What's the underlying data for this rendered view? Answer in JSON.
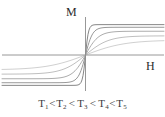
{
  "figure": {
    "axis_labels": {
      "y": "M",
      "x": "H"
    },
    "caption_terms": [
      {
        "symbol": "T",
        "subscript": "1"
      },
      {
        "symbol": "T",
        "subscript": "2"
      },
      {
        "symbol": "T",
        "subscript": "3"
      },
      {
        "symbol": "T",
        "subscript": "4"
      },
      {
        "symbol": "T",
        "subscript": "5"
      }
    ],
    "caption_relation": "<",
    "caption_text": "T1<T2< T3< T4<T5"
  },
  "colors": {
    "axis": "#8c8c8c",
    "curve_darkest": "#707070",
    "curve_lightest": "#c8c8c8",
    "text": "#2b2b2b",
    "caption_text": "#3a3a3a",
    "background": "#ffffff"
  },
  "chart_data": {
    "type": "line",
    "title": "",
    "xlabel": "H",
    "ylabel": "M",
    "xlim": [
      -1,
      1
    ],
    "ylim": [
      -1,
      1
    ],
    "grid": false,
    "legend": "none",
    "axis_style": "centered-cross",
    "annotations": [
      "T1<T2< T3< T4<T5"
    ],
    "series": [
      {
        "name": "T1",
        "saturation": 0.92,
        "steepness": 26,
        "color": "#707070",
        "x": [
          -1,
          -0.8,
          -0.6,
          -0.4,
          -0.25,
          -0.15,
          -0.08,
          -0.04,
          0,
          0.04,
          0.08,
          0.15,
          0.25,
          0.4,
          0.6,
          0.8,
          1
        ],
        "y": [
          -0.92,
          -0.92,
          -0.92,
          -0.92,
          -0.91,
          -0.9,
          -0.85,
          -0.7,
          0,
          0.7,
          0.85,
          0.9,
          0.91,
          0.92,
          0.92,
          0.92,
          0.92
        ]
      },
      {
        "name": "T2",
        "saturation": 0.84,
        "steepness": 11,
        "color": "#878787",
        "x": [
          -1,
          -0.8,
          -0.6,
          -0.4,
          -0.25,
          -0.15,
          -0.08,
          -0.04,
          0,
          0.04,
          0.08,
          0.15,
          0.25,
          0.4,
          0.6,
          0.8,
          1
        ],
        "y": [
          -0.84,
          -0.84,
          -0.83,
          -0.82,
          -0.79,
          -0.72,
          -0.55,
          -0.33,
          0,
          0.33,
          0.55,
          0.72,
          0.79,
          0.82,
          0.83,
          0.84,
          0.84
        ]
      },
      {
        "name": "T3",
        "saturation": 0.72,
        "steepness": 6,
        "color": "#9d9d9d",
        "x": [
          -1,
          -0.8,
          -0.6,
          -0.4,
          -0.25,
          -0.15,
          -0.08,
          -0.04,
          0,
          0.04,
          0.08,
          0.15,
          0.25,
          0.4,
          0.6,
          0.8,
          1
        ],
        "y": [
          -0.72,
          -0.71,
          -0.7,
          -0.66,
          -0.58,
          -0.45,
          -0.29,
          -0.16,
          0,
          0.16,
          0.29,
          0.45,
          0.58,
          0.66,
          0.7,
          0.71,
          0.72
        ]
      },
      {
        "name": "T4",
        "saturation": 0.58,
        "steepness": 3.4,
        "color": "#b3b3b3",
        "x": [
          -1,
          -0.8,
          -0.6,
          -0.4,
          -0.25,
          -0.15,
          -0.08,
          -0.04,
          0,
          0.04,
          0.08,
          0.15,
          0.25,
          0.4,
          0.6,
          0.8,
          1
        ],
        "y": [
          -0.58,
          -0.56,
          -0.53,
          -0.47,
          -0.37,
          -0.26,
          -0.15,
          -0.08,
          0,
          0.08,
          0.15,
          0.26,
          0.37,
          0.47,
          0.53,
          0.56,
          0.58
        ]
      },
      {
        "name": "T5",
        "saturation": 0.45,
        "steepness": 2,
        "color": "#c8c8c8",
        "x": [
          -1,
          -0.8,
          -0.6,
          -0.4,
          -0.25,
          -0.15,
          -0.08,
          -0.04,
          0,
          0.04,
          0.08,
          0.15,
          0.25,
          0.4,
          0.6,
          0.8,
          1
        ],
        "y": [
          -0.45,
          -0.42,
          -0.38,
          -0.31,
          -0.23,
          -0.15,
          -0.08,
          -0.04,
          0,
          0.04,
          0.08,
          0.15,
          0.23,
          0.31,
          0.38,
          0.42,
          0.45
        ]
      }
    ]
  }
}
